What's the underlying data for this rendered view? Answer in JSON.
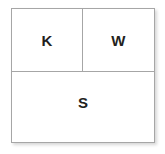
{
  "diagram": {
    "type": "partitioned-square",
    "colors": {
      "background": "#ffffff",
      "border": "#a6a6a6",
      "label": "#231f20"
    },
    "cells": [
      {
        "id": "top-left",
        "label": "K",
        "position": "top-left"
      },
      {
        "id": "top-right",
        "label": "W",
        "position": "top-right"
      },
      {
        "id": "bottom",
        "label": "S",
        "position": "bottom-full-width"
      }
    ]
  }
}
